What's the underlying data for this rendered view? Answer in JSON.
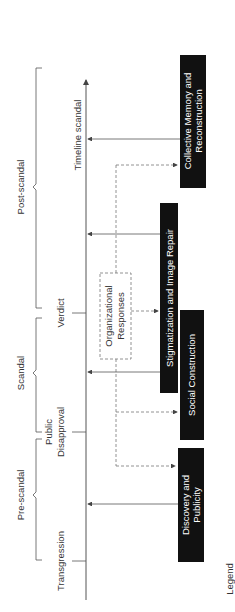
{
  "diagram": {
    "timeline_label": "Timeline scandal",
    "legend_label": "Legend",
    "phases": [
      {
        "label": "Pre-scandal"
      },
      {
        "label": "Scandal"
      },
      {
        "label": "Post-scandal"
      }
    ],
    "events": [
      {
        "label": "Transgression"
      },
      {
        "label_line1": "Public",
        "label_line2": "Disapproval"
      },
      {
        "label": "Verdict"
      }
    ],
    "center_box": {
      "line1": "Organizational",
      "line2": "Responses"
    },
    "processes": [
      {
        "line1": "Discovery and",
        "line2": "Publicity"
      },
      {
        "line1": "Social Construction"
      },
      {
        "line1": "Stigmatization and Image Repair"
      },
      {
        "line1": "Collective Memory and",
        "line2": "Reconstruction"
      }
    ],
    "colors": {
      "box_fill": "#111111",
      "line": "#555555",
      "dashed": "#777777",
      "text": "#333333"
    }
  }
}
